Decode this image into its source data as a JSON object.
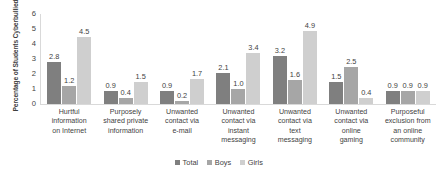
{
  "chart_data": {
    "type": "bar",
    "title": "",
    "xlabel": "",
    "ylabel": "Percentage of Students Cyberbullied",
    "ylim": [
      0,
      6
    ],
    "yticks": [
      0,
      1,
      2,
      3,
      4,
      5,
      6
    ],
    "grid": false,
    "legend_position": "bottom",
    "categories": [
      "Hurtful information on Internet",
      "Purposely shared private information",
      "Unwanted contact via e-mail",
      "Unwanted contact via instant messaging",
      "Unwanted contact via text messaging",
      "Unwanted contact via online gaming",
      "Purposeful exclusion from an online community"
    ],
    "series": [
      {
        "name": "Total",
        "color": "#7f7f7f",
        "values": [
          2.8,
          0.9,
          0.9,
          2.1,
          3.2,
          1.5,
          0.9
        ]
      },
      {
        "name": "Boys",
        "color": "#a6a6a6",
        "values": [
          1.2,
          0.4,
          0.2,
          1.0,
          1.6,
          2.5,
          0.9
        ]
      },
      {
        "name": "Girls",
        "color": "#cfcfcf",
        "values": [
          4.5,
          1.5,
          1.7,
          3.4,
          4.9,
          0.4,
          0.9
        ]
      }
    ]
  },
  "axis": {
    "y_title": "Percentage of Students Cyberbullied",
    "y_tick_labels": [
      "6",
      "5",
      "4",
      "3",
      "2",
      "1",
      "0"
    ]
  },
  "category_lines": [
    [
      "Hurtful",
      "information",
      "on Internet"
    ],
    [
      "Purposely",
      "shared private",
      "information"
    ],
    [
      "Unwanted",
      "contact via",
      "e-mail"
    ],
    [
      "Unwanted",
      "contact via",
      "instant",
      "messaging"
    ],
    [
      "Unwanted",
      "contact via",
      "text",
      "messaging"
    ],
    [
      "Unwanted",
      "contact via",
      "online",
      "gaming"
    ],
    [
      "Purposeful",
      "exclusion from",
      "an online",
      "community"
    ]
  ],
  "legend": {
    "items": [
      {
        "label": "Total",
        "color": "#7f7f7f"
      },
      {
        "label": "Boys",
        "color": "#a6a6a6"
      },
      {
        "label": "Girls",
        "color": "#cfcfcf"
      }
    ]
  },
  "colors": {
    "axis_line": "#d9d9d9",
    "text": "#3f3f3f",
    "background": "#ffffff"
  }
}
